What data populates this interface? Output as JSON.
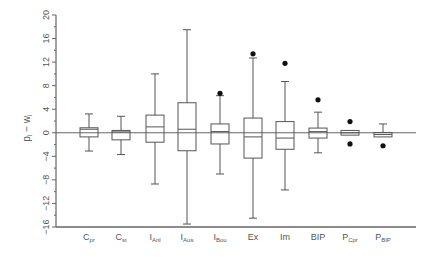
{
  "chart_data": {
    "type": "box",
    "title": "",
    "xlabel": "",
    "ylabel": "p_i − w_i",
    "ylabel_parts": {
      "p": "p",
      "p_sub": "i",
      "dash": " − ",
      "w": "w",
      "w_sub": "i"
    },
    "ylim": [
      -16,
      20
    ],
    "yticks": [
      -16,
      -12,
      -8,
      -4,
      0,
      4,
      8,
      12,
      16,
      20
    ],
    "grid": false,
    "reference_line": 0,
    "categories": [
      {
        "label": "C",
        "sub": "pr"
      },
      {
        "label": "C",
        "sub": "st"
      },
      {
        "label": "I",
        "sub": "Anl"
      },
      {
        "label": "I",
        "sub": "Aus"
      },
      {
        "label": "I",
        "sub": "Bou"
      },
      {
        "label": "Ex",
        "sub": ""
      },
      {
        "label": "Im",
        "sub": ""
      },
      {
        "label": "BIP",
        "sub": ""
      },
      {
        "label": "P",
        "sub": "Cpr"
      },
      {
        "label": "P",
        "sub": "BIP"
      }
    ],
    "boxes": [
      {
        "name": "C_pr",
        "whisker_low": -3.1,
        "q1": -0.7,
        "median": 0.6,
        "q3": 0.85,
        "whisker_high": 3.2,
        "outliers": []
      },
      {
        "name": "C_st",
        "whisker_low": -3.7,
        "q1": -1.2,
        "median": 0.15,
        "q3": 0.4,
        "whisker_high": 2.8,
        "outliers": []
      },
      {
        "name": "I_Anl",
        "whisker_low": -8.7,
        "q1": -1.6,
        "median": 1.0,
        "q3": 3.0,
        "whisker_high": 10.0,
        "outliers": []
      },
      {
        "name": "I_Aus",
        "whisker_low": -15.5,
        "q1": -3.05,
        "median": 0.6,
        "q3": 5.1,
        "whisker_high": 17.5,
        "outliers": []
      },
      {
        "name": "I_Bou",
        "whisker_low": -7.0,
        "q1": -1.9,
        "median": 0.2,
        "q3": 1.5,
        "whisker_high": 6.3,
        "outliers": [
          6.7
        ]
      },
      {
        "name": "Ex",
        "whisker_low": -14.5,
        "q1": -4.3,
        "median": -0.7,
        "q3": 2.5,
        "whisker_high": 12.7,
        "outliers": [
          13.4
        ]
      },
      {
        "name": "Im",
        "whisker_low": -9.7,
        "q1": -2.8,
        "median": -0.9,
        "q3": 1.9,
        "whisker_high": 8.7,
        "outliers": [
          11.8
        ]
      },
      {
        "name": "BIP",
        "whisker_low": -3.4,
        "q1": -0.9,
        "median": 0.2,
        "q3": 0.8,
        "whisker_high": 3.5,
        "outliers": [
          5.6
        ]
      },
      {
        "name": "P_Cpr",
        "whisker_low": -0.4,
        "q1": -0.4,
        "median": 0.0,
        "q3": 0.4,
        "whisker_high": 0.4,
        "outliers": [
          1.9,
          -1.9
        ]
      },
      {
        "name": "P_BIP",
        "whisker_low": -0.7,
        "q1": -0.7,
        "median": -0.3,
        "q3": 0.05,
        "whisker_high": 1.5,
        "outliers": [
          -2.2
        ]
      }
    ]
  },
  "colors": {
    "axis": "#666666",
    "box_stroke": "#555555",
    "outlier": "#111111",
    "text": "#555555"
  }
}
